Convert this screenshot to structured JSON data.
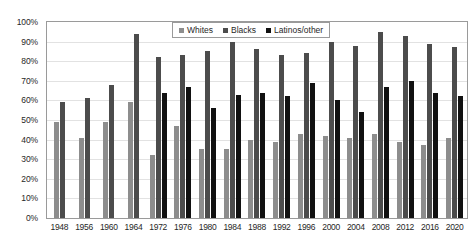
{
  "chart_data": {
    "type": "bar",
    "title": "",
    "xlabel": "",
    "ylabel": "",
    "ylim": [
      0,
      100
    ],
    "grid": true,
    "legend_position": "top-center-inside",
    "categories": [
      "1948",
      "1956",
      "1960",
      "1964",
      "1972",
      "1976",
      "1980",
      "1984",
      "1988",
      "1992",
      "1996",
      "2000",
      "2004",
      "2008",
      "2012",
      "2016",
      "2020"
    ],
    "ytick_labels": [
      "100%",
      "90%",
      "80%",
      "70%",
      "60%",
      "50%",
      "40%",
      "30%",
      "20%",
      "10%",
      "0%"
    ],
    "ytick_values": [
      100,
      90,
      80,
      70,
      60,
      50,
      40,
      30,
      20,
      10,
      0
    ],
    "series": [
      {
        "name": "Whites",
        "color": "#8d8d8d",
        "values": [
          49,
          41,
          49,
          59,
          32,
          47,
          35,
          35,
          40,
          39,
          43,
          42,
          41,
          43,
          39,
          37,
          41
        ]
      },
      {
        "name": "Blacks",
        "color": "#4c4c4c",
        "values": [
          59,
          61,
          68,
          94,
          82,
          83,
          85,
          90,
          86,
          83,
          84,
          90,
          88,
          95,
          93,
          89,
          87
        ]
      },
      {
        "name": "Latinos/other",
        "color": "#111111",
        "values": [
          null,
          null,
          null,
          null,
          64,
          67,
          56,
          63,
          64,
          62,
          69,
          60,
          54,
          67,
          70,
          64,
          62
        ]
      }
    ]
  }
}
